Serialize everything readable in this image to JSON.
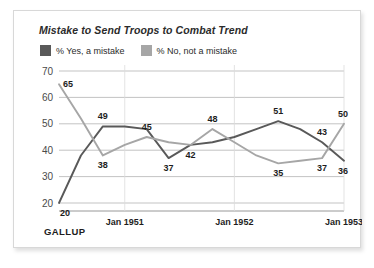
{
  "card": {
    "brand": "GALLUP"
  },
  "chart_data": {
    "type": "line",
    "title": "Mistake to Send Troops to Combat Trend",
    "xlabel": "",
    "ylabel": "",
    "ylim": [
      20,
      70
    ],
    "yticks": [
      20,
      30,
      40,
      50,
      60,
      70
    ],
    "grid": true,
    "legend_position": "top-left",
    "x_tick_labels": [
      "Jan 1951",
      "Jan 1952",
      "Jan 1953"
    ],
    "x_tick_positions": [
      3,
      8,
      13
    ],
    "series": [
      {
        "name": "% Yes, a mistake",
        "color": "#595959",
        "x": [
          0,
          1,
          2,
          3,
          4,
          5,
          6,
          7,
          8,
          9,
          10,
          11,
          12,
          13
        ],
        "values": [
          20,
          38,
          49,
          49,
          48,
          37,
          42,
          43,
          45,
          48,
          51,
          48,
          43,
          36
        ],
        "point_labels": [
          {
            "x": 0,
            "value": 20,
            "label": "20",
            "pos": "below"
          },
          {
            "x": 2,
            "value": 49,
            "label": "49",
            "pos": "above"
          },
          {
            "x": 5,
            "value": 37,
            "label": "37",
            "pos": "below"
          },
          {
            "x": 10,
            "value": 51,
            "label": "51",
            "pos": "above"
          },
          {
            "x": 12,
            "value": 43,
            "label": "43",
            "pos": "above"
          },
          {
            "x": 13,
            "value": 36,
            "label": "36",
            "pos": "below"
          }
        ]
      },
      {
        "name": "% No, not a mistake",
        "color": "#a6a6a6",
        "x": [
          0,
          1,
          2,
          3,
          4,
          5,
          6,
          7,
          8,
          9,
          10,
          11,
          12,
          13
        ],
        "values": [
          65,
          52,
          38,
          42,
          45,
          43,
          42,
          48,
          43,
          38,
          35,
          36,
          37,
          50
        ],
        "point_labels": [
          {
            "x": 0,
            "value": 65,
            "label": "65",
            "pos": "right"
          },
          {
            "x": 2,
            "value": 38,
            "label": "38",
            "pos": "below"
          },
          {
            "x": 4,
            "value": 45,
            "label": "45",
            "pos": "above"
          },
          {
            "x": 6,
            "value": 42,
            "label": "42",
            "pos": "below"
          },
          {
            "x": 7,
            "value": 48,
            "label": "48",
            "pos": "above"
          },
          {
            "x": 10,
            "value": 35,
            "label": "35",
            "pos": "below"
          },
          {
            "x": 12,
            "value": 37,
            "label": "37",
            "pos": "below"
          },
          {
            "x": 13,
            "value": 50,
            "label": "50",
            "pos": "above"
          }
        ]
      }
    ]
  },
  "legend": {
    "items": [
      {
        "label": "% Yes, a mistake",
        "color": "#595959"
      },
      {
        "label": "% No, not a mistake",
        "color": "#a6a6a6"
      }
    ]
  },
  "axis": {
    "y_labels": [
      "70",
      "60",
      "50",
      "40",
      "30",
      "20"
    ],
    "x_labels": [
      "Jan 1951",
      "Jan 1952",
      "Jan 1953"
    ]
  }
}
